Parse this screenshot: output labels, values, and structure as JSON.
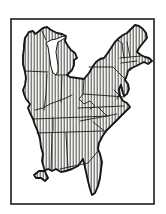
{
  "figure": {
    "type": "map",
    "region_label": "Eastern United States",
    "background_color": "#ffffff",
    "frame_color": "#2a2a2a",
    "outline_color": "#161616",
    "border_line_color": "#1d1d1d",
    "hatch_color": "#242424",
    "land_fill": "#f5f4f1",
    "water_fill": "#ffffff"
  },
  "map": {
    "outline_path": "M24,45 L25,38 L29,32 L33,31 L35,34 L38,32 L43,28 L47,27 L51,30 L57,33 L62,34 L66,36 L65,41 L68,46 L71,50 L75,53 L77,58 L74,60 L74,65 L72,70 L67,75 L70,77 L77,78 L84,79 L89,73 L93,66 L96,62 L100,59 L104,58 L107,54 L111,48 L115,42 L119,38 L123,35 L127,33 L131,29 L135,25 L139,26 L143,29 L146,33 L147,38 L143,43 L139,48 L137,52 L141,55 L145,57 L149,58 L152,61 L148,64 L144,62 L138,65 L132,68 L128,71 L127,75 L125,80 L128,84 L129,89 L127,94 L124,96 L122,90 L121,85 L119,89 L120,96 L123,101 L127,103 L130,107 L126,111 L122,115 L117,120 L111,126 L106,131 L102,137 L99,143 L98,149 L100,154 L102,162 L101,170 L100,178 L98,186 L95,193 L92,195 L90,189 L88,181 L86,172 L84,163 L83,159 L78,166 L72,169 L66,171 L61,172 L56,169 L52,171 L48,169 L44,171 L39,171 L34,175 L36,178 L41,178 L45,181 L48,178 L46,174 L44,168 L42,161 L43,154 L41,147 L40,139 L38,132 L35,125 L33,119 L30,113 L28,108 L30,104 L26,99 L24,94 L23,90 L25,85 L26,78 L25,72 L23,64 L23,56 L24,48 Z",
    "lake_michigan_path": "M46,43 L51,40 L56,39 L61,37 L64,36 L66,37 L62,40 L58,42 L57,46 L56,52 L57,59 L58,65 L58,71 L56,75 L53,73 L51,67 L50,60 L49,53 L48,47 Z",
    "state_borders": [
      "M25,71 L48,72",
      "M47,74 L46,94 L44,110",
      "M35,110 L43,108 L50,104 L58,101 L66,98 L72,95",
      "M62,76 L61,102",
      "M56,75 L67,75",
      "M42,31 L46,40",
      "M84,79 L83,94",
      "M83,94 L125,97",
      "M89,67 L113,67 L126,80",
      "M83,94 L79,99 L84,104 L90,101 L95,106 L90,109",
      "M34,119 L108,116",
      "M78,108 L124,106",
      "M98,107 L107,116",
      "M37,133 L103,131",
      "M80,121 L117,114",
      "M93,122 L106,132",
      "M52,133 L51,170",
      "M66,133 L68,168",
      "M60,169 L88,163 L98,151",
      "M53,118 L53,131",
      "M122,44 L124,58 M127,42 L130,57 M120,58 L141,56 M121,63 L137,61 M118,40 L123,44 M129,69 L139,65",
      "M114,90 L119,95 L117,99 M121,84 L123,91"
    ]
  }
}
